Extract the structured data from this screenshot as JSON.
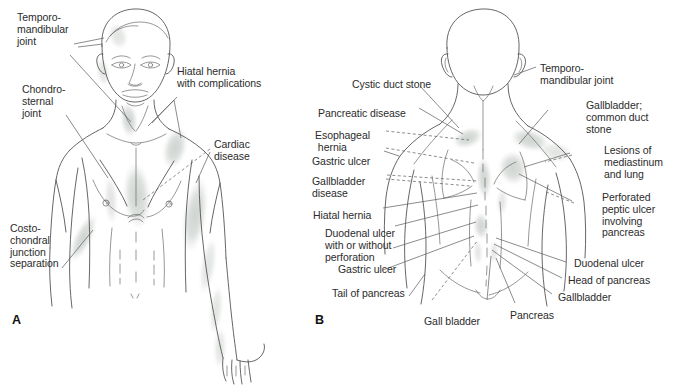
{
  "figure": {
    "panels": [
      {
        "id": "A",
        "letter": "A",
        "view": "anterior"
      },
      {
        "id": "B",
        "letter": "B",
        "view": "posterior"
      }
    ],
    "colors": {
      "outline": "#4a4a4a",
      "leader": "#5a5a5a",
      "shade_light": "#e9ebe9",
      "shade_mid": "#d9dcd9",
      "shade_dark": "#c9cdc9",
      "text": "#2b2b2b",
      "background": "#ffffff"
    }
  },
  "panel_a": {
    "letter": "A",
    "labels": [
      {
        "id": "temporomandibular-joint",
        "text": "Temporo-\nmandibular\njoint",
        "align": "left"
      },
      {
        "id": "chondrosternal-joint",
        "text": "Chondro-\nsternal\njoint",
        "align": "left"
      },
      {
        "id": "costochondral-junction-separation",
        "text": "Costo-\nchondral\njunction\nseparation",
        "align": "left"
      },
      {
        "id": "hiatal-hernia-with-complications",
        "text": "Hiatal hernia\nwith complications",
        "align": "left"
      },
      {
        "id": "cardiac-disease",
        "text": "Cardiac\ndisease",
        "align": "left"
      }
    ]
  },
  "panel_b": {
    "letter": "B",
    "labels_left": [
      {
        "id": "cystic-duct-stone",
        "text": "Cystic duct stone"
      },
      {
        "id": "pancreatic-disease",
        "text": "Pancreatic disease"
      },
      {
        "id": "esophageal-hernia",
        "text": "Esophageal\n hernia"
      },
      {
        "id": "gastric-ulcer-upper",
        "text": "Gastric ulcer"
      },
      {
        "id": "gallbladder-disease",
        "text": "Gallbladder\ndisease"
      },
      {
        "id": "hiatal-hernia",
        "text": "Hiatal hernia"
      },
      {
        "id": "duodenal-ulcer-with-or-without-perforation",
        "text": "Duodenal ulcer\nwith or without\nperforation"
      },
      {
        "id": "gastric-ulcer-lower",
        "text": "Gastric ulcer"
      },
      {
        "id": "tail-of-pancreas",
        "text": "Tail of pancreas"
      }
    ],
    "labels_right": [
      {
        "id": "temporomandibular-joint-b",
        "text": "Temporo-\nmandibular joint"
      },
      {
        "id": "gallbladder-common-duct-stone",
        "text": "Gallbladder;\ncommon duct\nstone"
      },
      {
        "id": "lesions-of-mediastinum-and-lung",
        "text": "Lesions of\nmediastinum\nand lung"
      },
      {
        "id": "perforated-peptic-ulcer-involving-pancreas",
        "text": "Perforated\npeptic ulcer\ninvolving\npancreas"
      },
      {
        "id": "duodenal-ulcer",
        "text": "Duodenal ulcer"
      },
      {
        "id": "head-of-pancreas",
        "text": "Head of pancreas"
      },
      {
        "id": "gallbladder",
        "text": "Gallbladder"
      }
    ],
    "labels_bottom": [
      {
        "id": "gall-bladder",
        "text": "Gall bladder"
      },
      {
        "id": "pancreas",
        "text": "Pancreas"
      }
    ]
  }
}
